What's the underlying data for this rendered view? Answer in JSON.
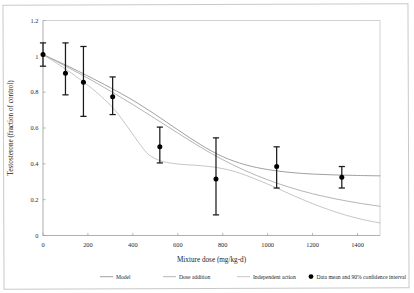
{
  "figure": {
    "background_color": "#ffffff",
    "frame_color": "#c9c9c9"
  },
  "chart_data": {
    "type": "line",
    "title": "",
    "xlabel": "Mixture dose (mg/kg-d)",
    "ylabel": "Testosterone (fraction of control)",
    "xlim": [
      0,
      1500
    ],
    "ylim": [
      0,
      1.2
    ],
    "xticks": [
      0,
      200,
      400,
      600,
      800,
      1000,
      1200,
      1400
    ],
    "xtick_labels": [
      "0",
      "200",
      "400",
      "600",
      "800",
      "1000",
      "1200",
      "1400"
    ],
    "yticks": [
      0,
      0.2,
      0.4,
      0.6,
      0.8,
      1,
      1.2
    ],
    "ytick_labels": [
      "0",
      "0.2",
      "0.4",
      "0.6",
      "0.8",
      "1",
      "1.2"
    ],
    "grid": false,
    "legend_position": "below",
    "series": [
      {
        "name": "Model",
        "kind": "line",
        "color": "#8f8f8f",
        "x": [
          0,
          60,
          120,
          200,
          300,
          400,
          500,
          600,
          700,
          800,
          900,
          1000,
          1100,
          1200,
          1300,
          1400,
          1500
        ],
        "values": [
          1.01,
          0.975,
          0.94,
          0.89,
          0.825,
          0.755,
          0.675,
          0.59,
          0.508,
          0.44,
          0.395,
          0.368,
          0.352,
          0.343,
          0.338,
          0.335,
          0.333
        ]
      },
      {
        "name": "Dose addition",
        "kind": "line",
        "color": "#a8a8a8",
        "x": [
          0,
          60,
          120,
          200,
          300,
          400,
          500,
          600,
          700,
          800,
          900,
          1000,
          1100,
          1200,
          1300,
          1400,
          1500
        ],
        "values": [
          1.01,
          0.972,
          0.932,
          0.878,
          0.806,
          0.731,
          0.652,
          0.572,
          0.494,
          0.423,
          0.362,
          0.311,
          0.268,
          0.233,
          0.205,
          0.182,
          0.163
        ]
      },
      {
        "name": "Independent action",
        "kind": "line",
        "color": "#bcbcbc",
        "x": [
          0,
          60,
          120,
          200,
          260,
          320,
          380,
          430,
          470,
          520,
          580,
          640,
          700,
          780,
          860,
          940,
          1020,
          1120,
          1220,
          1320,
          1420,
          1500
        ],
        "values": [
          1.01,
          0.962,
          0.912,
          0.838,
          0.775,
          0.7,
          0.6,
          0.512,
          0.452,
          0.418,
          0.402,
          0.395,
          0.39,
          0.378,
          0.355,
          0.318,
          0.276,
          0.22,
          0.168,
          0.124,
          0.09,
          0.07
        ]
      }
    ],
    "points_series": {
      "name": "Data mean and 90% confidence interval",
      "marker_color": "#000000",
      "points": [
        {
          "x": 0,
          "y": 1.01,
          "low": 0.945,
          "high": 1.075
        },
        {
          "x": 100,
          "y": 0.905,
          "low": 0.785,
          "high": 1.075
        },
        {
          "x": 180,
          "y": 0.855,
          "low": 0.665,
          "high": 1.055
        },
        {
          "x": 310,
          "y": 0.775,
          "low": 0.675,
          "high": 0.885
        },
        {
          "x": 520,
          "y": 0.495,
          "low": 0.405,
          "high": 0.605
        },
        {
          "x": 770,
          "y": 0.315,
          "low": 0.115,
          "high": 0.545
        },
        {
          "x": 1040,
          "y": 0.385,
          "low": 0.265,
          "high": 0.495
        },
        {
          "x": 1330,
          "y": 0.325,
          "low": 0.265,
          "high": 0.385
        }
      ]
    },
    "legend": [
      {
        "label": "Model",
        "color": "#8f8f8f",
        "symbol": "line"
      },
      {
        "label": "Dose addition",
        "color": "#a8a8a8",
        "symbol": "line"
      },
      {
        "label": "Independent action",
        "color": "#bcbcbc",
        "symbol": "line"
      },
      {
        "label": "Data mean and 90% confidence interval",
        "color": "#000000",
        "symbol": "dot"
      }
    ]
  }
}
